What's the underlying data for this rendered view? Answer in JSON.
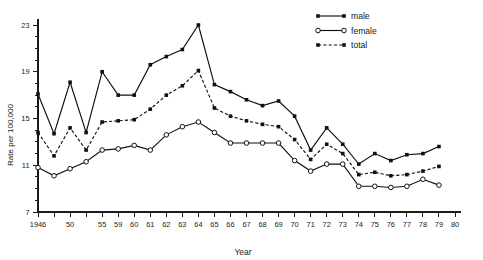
{
  "chart_data": {
    "type": "line",
    "title": "",
    "xlabel": "Year",
    "ylabel": "Rate per 100,000",
    "ylim": [
      7,
      23
    ],
    "y_major_ticks": [
      7,
      11,
      15,
      19,
      23
    ],
    "y_minor_tick_step": 1,
    "grid": false,
    "legend_position": "top-right",
    "x": [
      1946,
      1948,
      1950,
      1952,
      1955,
      1959,
      1960,
      1961,
      1962,
      1963,
      1964,
      1965,
      1966,
      1967,
      1968,
      1969,
      1970,
      1971,
      1972,
      1973,
      1974,
      1975,
      1976,
      1977,
      1978,
      1979
    ],
    "x_tick_labels": [
      "1946",
      "",
      "50",
      "",
      "55",
      "59",
      "60",
      "61",
      "62",
      "63",
      "64",
      "65",
      "66",
      "67",
      "68",
      "69",
      "70",
      "71",
      "72",
      "73",
      "74",
      "75",
      "76",
      "77",
      "78",
      "79",
      "80"
    ],
    "x_axis_end_label": "80",
    "series": [
      {
        "name": "male",
        "style": "solid",
        "marker": "filled-square",
        "values": [
          17.1,
          13.7,
          18.1,
          13.8,
          19.0,
          17.0,
          17.0,
          19.6,
          20.3,
          20.9,
          23.0,
          17.9,
          17.3,
          16.6,
          16.1,
          16.5,
          15.2,
          12.3,
          14.2,
          12.8,
          11.1,
          12.0,
          11.4,
          11.9,
          12.0,
          12.6
        ]
      },
      {
        "name": "female",
        "style": "solid",
        "marker": "open-circle",
        "values": [
          10.8,
          10.1,
          10.7,
          11.3,
          12.3,
          12.4,
          12.7,
          12.3,
          13.6,
          14.3,
          14.7,
          13.8,
          12.9,
          12.9,
          12.9,
          12.9,
          11.4,
          10.5,
          11.1,
          11.1,
          9.2,
          9.2,
          9.1,
          9.2,
          9.8,
          9.3
        ]
      },
      {
        "name": "total",
        "style": "dashed",
        "marker": "filled-square",
        "values": [
          13.8,
          11.8,
          14.2,
          12.3,
          14.7,
          14.8,
          14.9,
          15.8,
          17.0,
          17.8,
          19.1,
          15.9,
          15.2,
          14.8,
          14.5,
          14.3,
          13.2,
          11.5,
          12.8,
          12.0,
          10.2,
          10.4,
          10.1,
          10.2,
          10.5,
          10.9
        ]
      }
    ]
  },
  "legend": {
    "items": [
      {
        "label": "male"
      },
      {
        "label": "female"
      },
      {
        "label": "total"
      }
    ]
  },
  "axes": {
    "y_title": "Rate per 100,000",
    "x_title": "Year"
  }
}
